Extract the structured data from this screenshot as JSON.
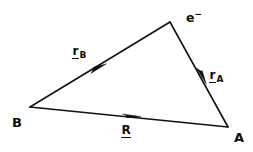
{
  "figure": {
    "kind": "vector-triangle-diagram",
    "width": 253,
    "height": 152,
    "background_color": "#ffffff",
    "ink_color": "#111111"
  },
  "vertices": {
    "electron": {
      "label": "e",
      "charge_sign": "−",
      "x": 170,
      "y": 22
    },
    "b": {
      "label": "B",
      "x": 30,
      "y": 107
    },
    "a": {
      "label": "A",
      "x": 228,
      "y": 127
    }
  },
  "vectors": [
    {
      "name": "r-sub-b",
      "symbol": "r",
      "subscript": "B",
      "from": "B",
      "to": "electron",
      "arrow_x": 100,
      "arrow_y": 68
    },
    {
      "name": "r-sub-a",
      "symbol": "r",
      "subscript": "A",
      "from": "electron",
      "to": "A",
      "arrow_x": 202,
      "arrow_y": 76
    },
    {
      "name": "r-capital",
      "symbol": "R",
      "subscript": "",
      "from": "B",
      "to": "A",
      "arrow_x": 133,
      "arrow_y": 116
    }
  ],
  "edges": [
    {
      "name": "edge-b-to-electron",
      "x1": 30,
      "y1": 107,
      "x2": 170,
      "y2": 22
    },
    {
      "name": "edge-electron-to-a",
      "x1": 170,
      "y1": 22,
      "x2": 228,
      "y2": 127
    },
    {
      "name": "edge-b-to-a",
      "x1": 30,
      "y1": 107,
      "x2": 228,
      "y2": 127
    }
  ]
}
